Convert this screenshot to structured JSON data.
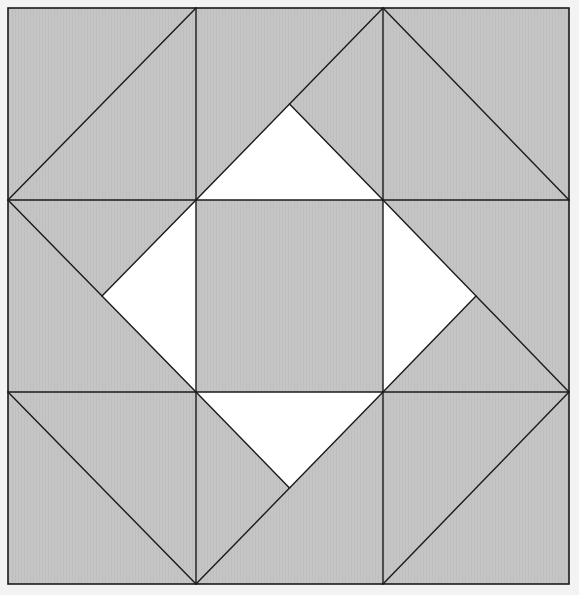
{
  "diagram": {
    "type": "quilt-block",
    "grid": {
      "rows": 3,
      "cols": 3
    },
    "colors": {
      "background": "#f3f3f3",
      "fabric": "#c5c5c5",
      "accent_fabric": "#ffffff",
      "seam": "#1a1a1a"
    },
    "cells": [
      {
        "id": "top-left",
        "row": 0,
        "col": 0,
        "diagonal": "/",
        "split": null
      },
      {
        "id": "top-middle",
        "row": 0,
        "col": 1,
        "diagonal": "/",
        "split": "center-to-bottom-right"
      },
      {
        "id": "top-right",
        "row": 0,
        "col": 2,
        "diagonal": "\\",
        "split": null
      },
      {
        "id": "middle-left",
        "row": 1,
        "col": 0,
        "diagonal": "\\",
        "split": "center-to-top-right"
      },
      {
        "id": "center",
        "row": 1,
        "col": 1,
        "diagonal": null,
        "split": null
      },
      {
        "id": "middle-right",
        "row": 1,
        "col": 2,
        "diagonal": "\\",
        "split": "center-to-bottom-left"
      },
      {
        "id": "bottom-left",
        "row": 2,
        "col": 0,
        "diagonal": "\\",
        "split": null
      },
      {
        "id": "bottom-middle",
        "row": 2,
        "col": 1,
        "diagonal": "/",
        "split": "top-left-to-center"
      },
      {
        "id": "bottom-right",
        "row": 2,
        "col": 2,
        "diagonal": "/",
        "split": null
      }
    ],
    "white_triangles": [
      {
        "id": "white-triangle-top",
        "cell": "top-middle",
        "corners": [
          "bottom-left",
          "center",
          "bottom-right"
        ]
      },
      {
        "id": "white-triangle-left",
        "cell": "middle-left",
        "corners": [
          "top-right",
          "center",
          "bottom-right"
        ]
      },
      {
        "id": "white-triangle-right",
        "cell": "middle-right",
        "corners": [
          "top-left",
          "center",
          "bottom-left"
        ]
      },
      {
        "id": "white-triangle-bottom",
        "cell": "bottom-middle",
        "corners": [
          "top-left",
          "center",
          "top-right"
        ]
      }
    ]
  }
}
